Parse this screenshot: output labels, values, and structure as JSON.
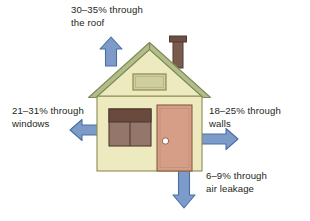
{
  "diagram": {
    "type": "heat-loss-house-diagram",
    "background_color": "#ffffff",
    "text_color": "#231f20",
    "labels": {
      "roof": "30–35% through\nthe roof",
      "windows": "21–31% through\nwindows",
      "walls": "18–25% through\nwalls",
      "air_leakage": "6–9% through\nair leakage"
    },
    "values": {
      "roof": "30–35%",
      "windows": "21–31%",
      "walls": "18–25%",
      "air_leakage": "6–9%"
    },
    "arrows": [
      {
        "name": "roof-arrow",
        "direction": "up",
        "color": "#7d9bc8",
        "outline": "#4a6ea4"
      },
      {
        "name": "windows-arrow",
        "direction": "left",
        "color": "#7d9bc8",
        "outline": "#4a6ea4"
      },
      {
        "name": "walls-arrow",
        "direction": "right",
        "color": "#7d9bc8",
        "outline": "#4a6ea4"
      },
      {
        "name": "air-leakage-arrow",
        "direction": "down",
        "color": "#7d9bc8",
        "outline": "#4a6ea4"
      }
    ],
    "house": {
      "wall_color": "#edeabf",
      "wall_outline": "#8f8a52",
      "roof_color": "#b2bd8a",
      "roof_outline": "#7d8a57",
      "chimney_color": "#7a5c4e",
      "chimney_outline": "#4f3a30",
      "door_color": "#d69e86",
      "door_outline": "#8a5a42",
      "doorknob_color": "#ffffff",
      "window_top_color": "#6a4a3c",
      "window_pane_color": "#94766a",
      "window_outline": "#4f3a30",
      "attic_vent_color": "#cfce9e",
      "attic_vent_outline": "#8f8a52"
    }
  }
}
